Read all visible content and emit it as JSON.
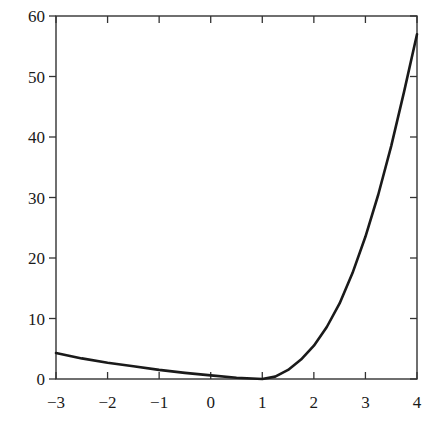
{
  "chart_data": {
    "type": "line",
    "title": "",
    "xlabel": "",
    "ylabel": "",
    "xlim": [
      -3,
      4
    ],
    "ylim": [
      0,
      60
    ],
    "grid": false,
    "legend": null,
    "x_ticks": [
      "-3",
      "-2",
      "-1",
      "0",
      "1",
      "2",
      "3",
      "4"
    ],
    "y_ticks": [
      "0",
      "10",
      "20",
      "30",
      "40",
      "50",
      "60"
    ],
    "series": [
      {
        "name": "curve",
        "color": "#1a1a1a",
        "x": [
          -3,
          -2.5,
          -2,
          -1.5,
          -1,
          -0.5,
          0,
          0.5,
          1,
          1.25,
          1.5,
          1.75,
          2,
          2.25,
          2.5,
          2.75,
          3,
          3.25,
          3.5,
          3.75,
          4
        ],
        "y": [
          4.3,
          3.4,
          2.7,
          2.1,
          1.5,
          1.0,
          0.6,
          0.2,
          0.0,
          0.4,
          1.5,
          3.2,
          5.5,
          8.6,
          12.5,
          17.5,
          23.5,
          30.5,
          38.5,
          47.5,
          57.0
        ]
      }
    ]
  }
}
